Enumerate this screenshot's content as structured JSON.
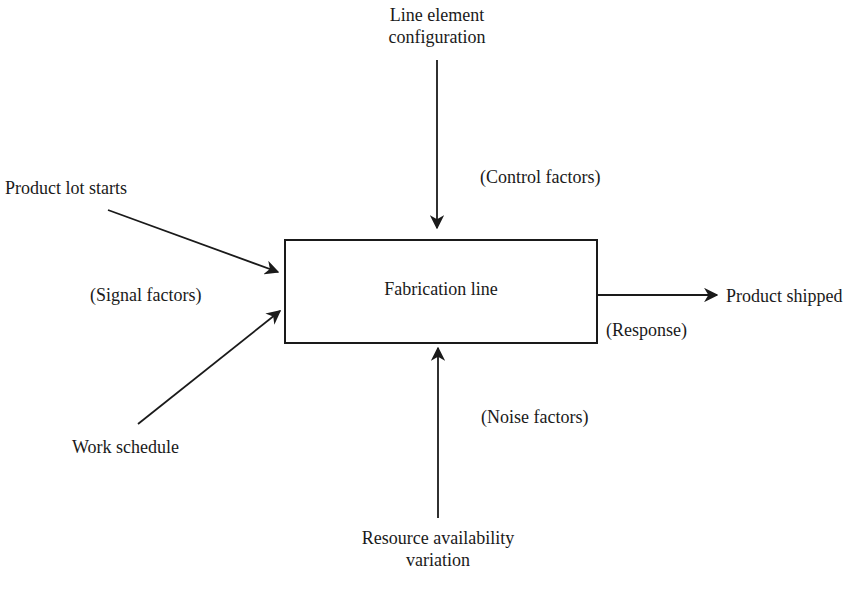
{
  "diagram": {
    "type": "process-block-diagram",
    "process": {
      "label": "Fabrication line"
    },
    "inputs": {
      "control": {
        "source": "Line element\nconfiguration",
        "source_lines": [
          "Line element",
          "configuration"
        ],
        "category": "(Control factors)"
      },
      "signal": {
        "sources": [
          "Product lot starts",
          "Work schedule"
        ],
        "category": "(Signal factors)"
      },
      "noise": {
        "source_lines": [
          "Resource availability",
          "variation"
        ],
        "category": "(Noise factors)"
      }
    },
    "output": {
      "target": "Product shipped",
      "category": "(Response)"
    },
    "colors": {
      "line": "#1a1a1a",
      "background": "#ffffff"
    }
  }
}
